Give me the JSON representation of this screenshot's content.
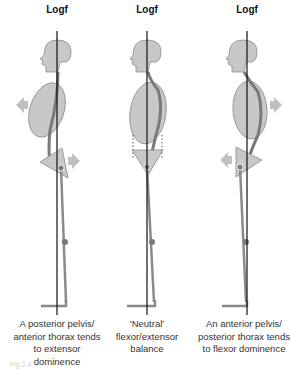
{
  "panels": [
    {
      "line_label": "Logf",
      "caption": "A posterior pelvis/ anterior thorax tends to extensor dominence",
      "state": "posterior-pelvis"
    },
    {
      "line_label": "Logf",
      "caption": "'Neutral' flexor/extensor balance",
      "state": "neutral"
    },
    {
      "line_label": "Logf",
      "caption": "An anterior pelvis/ posterior thorax tends to flexor dominence",
      "state": "anterior-pelvis"
    }
  ],
  "figure_caption": "Fig 2.4",
  "colors": {
    "body_fill": "#c8c8c8",
    "body_stroke": "#8a8a8a",
    "muscle": "#7a7a7a",
    "line": "#111111",
    "arrow": "#c0c0c0"
  }
}
